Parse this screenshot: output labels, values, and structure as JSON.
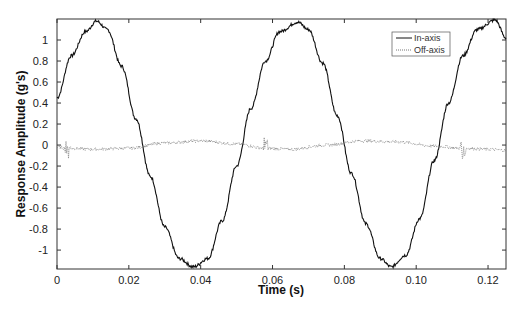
{
  "chart_data": {
    "type": "line",
    "title": "",
    "xlabel": "Time (s)",
    "ylabel": "Response Amplitude (g's)",
    "xlim": [
      0,
      0.125
    ],
    "ylim": [
      -1.18,
      1.2
    ],
    "xticks": [
      0,
      0.02,
      0.04,
      0.06,
      0.08,
      0.1,
      0.12
    ],
    "xtick_labels": [
      "0",
      "0.02",
      "0.04",
      "0.06",
      "0.08",
      "0.10",
      "0.12"
    ],
    "yticks": [
      1,
      0.8,
      0.6,
      0.4,
      0.2,
      0,
      -0.2,
      -0.4,
      -0.6,
      -0.8,
      -1
    ],
    "ytick_labels": [
      "1",
      "0.8",
      "0.6",
      "0.4",
      "0.2",
      "0",
      "-0.2",
      "-0.4",
      "-0.6",
      "-0.8",
      "-1"
    ],
    "grid": false,
    "legend_position": "top-right",
    "series": [
      {
        "name": "In-axis",
        "style": "solid",
        "color": "#111111",
        "description": "Noisy sinusoid, amplitude ~1.15 g, period ~0.0555 s",
        "x": [
          0,
          0.004,
          0.008,
          0.011,
          0.014,
          0.018,
          0.022,
          0.026,
          0.03,
          0.034,
          0.038,
          0.042,
          0.046,
          0.05,
          0.054,
          0.058,
          0.062,
          0.067,
          0.07,
          0.074,
          0.078,
          0.082,
          0.086,
          0.09,
          0.093,
          0.097,
          0.101,
          0.105,
          0.109,
          0.113,
          0.117,
          0.122,
          0.125
        ],
        "y": [
          0.45,
          0.85,
          1.08,
          1.18,
          1.1,
          0.75,
          0.25,
          -0.3,
          -0.78,
          -1.08,
          -1.16,
          -1.08,
          -0.72,
          -0.2,
          0.35,
          0.8,
          1.08,
          1.17,
          1.1,
          0.78,
          0.28,
          -0.27,
          -0.75,
          -1.08,
          -1.16,
          -1.05,
          -0.7,
          -0.15,
          0.4,
          0.85,
          1.1,
          1.19,
          1.02
        ]
      },
      {
        "name": "Off-axis",
        "style": "dotted",
        "color": "#777777",
        "description": "Low-level noise near 0 g with small bursts at ~0.003, 0.058, 0.113 s",
        "x": [
          0,
          0.003,
          0.01,
          0.02,
          0.03,
          0.04,
          0.05,
          0.058,
          0.065,
          0.075,
          0.085,
          0.095,
          0.105,
          0.113,
          0.12,
          0.125
        ],
        "y": [
          -0.02,
          -0.03,
          -0.04,
          -0.03,
          0.02,
          0.04,
          0.01,
          -0.03,
          -0.04,
          0.0,
          0.04,
          0.03,
          -0.01,
          -0.03,
          -0.04,
          -0.05
        ]
      }
    ]
  },
  "legend": {
    "items": [
      {
        "label": "In-axis"
      },
      {
        "label": "Off-axis"
      }
    ]
  }
}
